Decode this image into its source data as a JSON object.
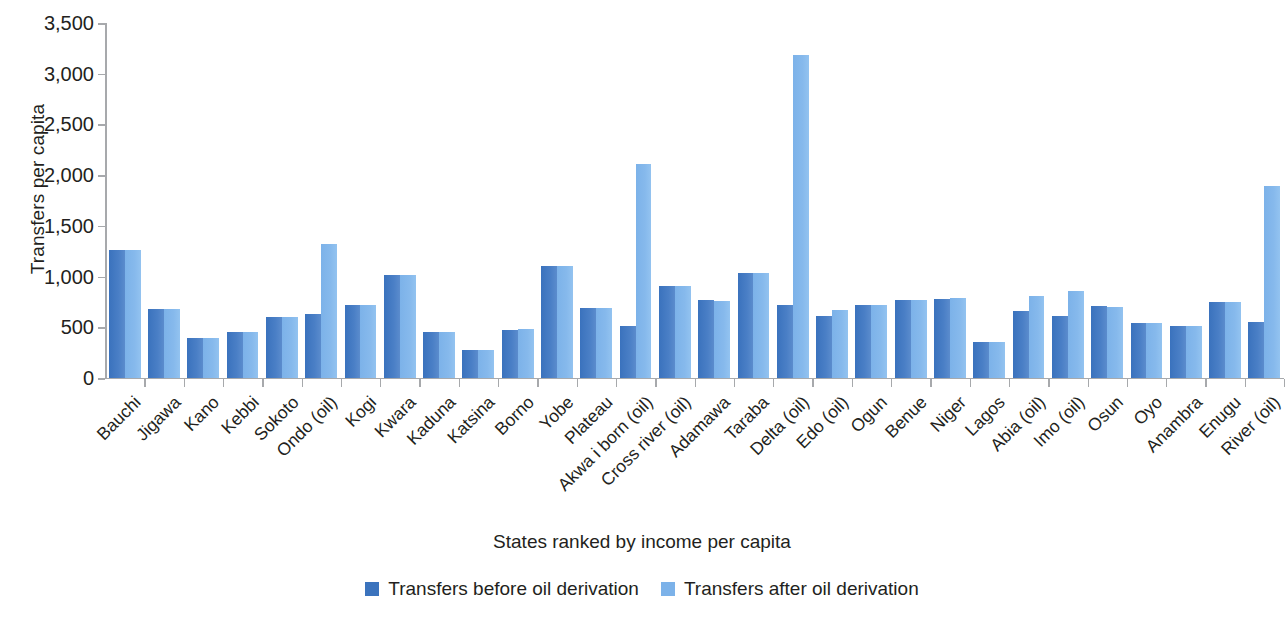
{
  "chart_data": {
    "type": "bar",
    "title": "",
    "xlabel": "States ranked by income per capita",
    "ylabel": "Transfers per capita",
    "ylim": [
      0,
      3500
    ],
    "ytick_values": [
      0,
      500,
      1000,
      1500,
      2000,
      2500,
      3000,
      3500
    ],
    "ytick_labels": [
      "0",
      "500",
      "1,000",
      "1,500",
      "2,000",
      "2,500",
      "3,000",
      "3,500"
    ],
    "grid": false,
    "legend_position": "bottom-center",
    "categories": [
      "Bauchi",
      "Jigawa",
      "Kano",
      "Kebbi",
      "Sokoto",
      "Ondo (oil)",
      "Kogi",
      "Kwara",
      "Kaduna",
      "Katsina",
      "Borno",
      "Yobe",
      "Plateau",
      "Akwa i born (oil)",
      "Cross river (oil)",
      "Adamawa",
      "Taraba",
      "Delta (oil)",
      "Edo (oil)",
      "Ogun",
      "Benue",
      "Niger",
      "Lagos",
      "Abia (oil)",
      "Imo (oil)",
      "Osun",
      "Oyo",
      "Anambra",
      "Enugu",
      "River (oil)"
    ],
    "series": [
      {
        "name": "Transfers before oil derivation",
        "color": "#3b73bd",
        "values": [
          1265,
          680,
          390,
          450,
          600,
          630,
          720,
          1015,
          450,
          275,
          470,
          1100,
          695,
          510,
          905,
          765,
          1040,
          720,
          610,
          720,
          765,
          780,
          360,
          665,
          615,
          710,
          545,
          510,
          750,
          555
        ]
      },
      {
        "name": "Transfers after oil derivation",
        "color": "#7cb2e9",
        "values": [
          1265,
          680,
          390,
          450,
          600,
          1320,
          720,
          1015,
          450,
          275,
          485,
          1105,
          690,
          2110,
          905,
          760,
          1035,
          3180,
          670,
          720,
          765,
          785,
          360,
          810,
          860,
          705,
          545,
          510,
          750,
          1890
        ]
      }
    ]
  },
  "legend": [
    {
      "label": "Transfers before oil derivation",
      "color": "#3b73bd"
    },
    {
      "label": "Transfers after oil derivation",
      "color": "#7cb2e9"
    }
  ]
}
